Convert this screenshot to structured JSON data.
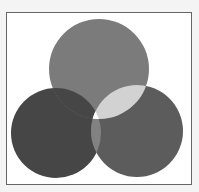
{
  "diagram": {
    "type": "venn",
    "sets": [
      {
        "name": "top-circle",
        "cx": 99,
        "cy": 69,
        "r": 50,
        "color": "#7b7b7b"
      },
      {
        "name": "left-circle",
        "cx": 56,
        "cy": 133,
        "r": 45,
        "color": "#464646"
      },
      {
        "name": "right-circle",
        "cx": 137,
        "cy": 131,
        "r": 46,
        "color": "#5c5c5c"
      }
    ],
    "overlaps": {
      "top_right": "#d2d2d2",
      "left_right": "#828282",
      "top_left": "#464646",
      "all": "#ffffff"
    },
    "frame_border": "#666666"
  }
}
